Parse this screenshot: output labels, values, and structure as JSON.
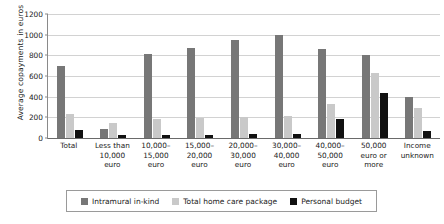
{
  "chart_data": {
    "type": "bar",
    "title": "",
    "xlabel": "",
    "ylabel": "Average copayments in euros",
    "ylim": [
      0,
      1200
    ],
    "ytick_step": 200,
    "yticks": [
      "0",
      "200",
      "400",
      "600",
      "800",
      "1000",
      "1200"
    ],
    "grid": true,
    "legend_position": "bottom",
    "categories": [
      "Total",
      "Less than\n10,000\neuro",
      "10,000–\n15,000\neuro",
      "15,000–\n20,000\neuro",
      "20,000–\n30,000\neuro",
      "30,000–\n40,000\neuro",
      "40,000–\n50,000\neuro",
      "50,000\neuro or\nmore",
      "Income\nunknown"
    ],
    "series": [
      {
        "name": "Intramural in-kind",
        "color": "#777777",
        "values": [
          700,
          90,
          810,
          870,
          950,
          1000,
          860,
          800,
          400
        ]
      },
      {
        "name": "Total home care package",
        "color": "#c9c9c9",
        "values": [
          230,
          150,
          180,
          190,
          200,
          210,
          330,
          630,
          290
        ]
      },
      {
        "name": "Personal budget",
        "color": "#111111",
        "values": [
          80,
          30,
          30,
          30,
          35,
          40,
          180,
          440,
          70
        ]
      }
    ]
  }
}
